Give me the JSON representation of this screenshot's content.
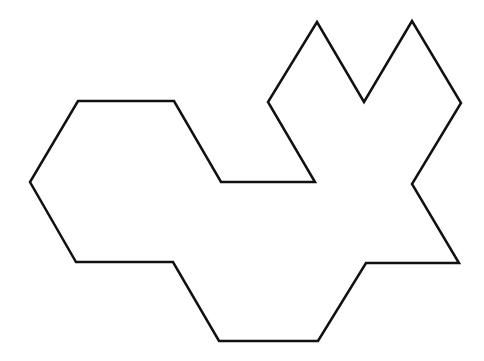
{
  "diagram": {
    "title": "",
    "shape": {
      "type": "polygon",
      "stroke": "#111111",
      "stroke_width": 2.5,
      "fill": "none",
      "points": "78,101 174,101 221,182 315,182 268,102 317,22 364,102 412,21 461,103 412,184 459,263 366,263 318,341 219,341 173,262 76,262 30,182"
    }
  }
}
